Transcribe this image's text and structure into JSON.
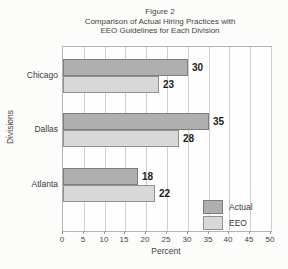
{
  "figure": {
    "title_line1": "Figure 2",
    "title_line2": "Comparison of Actual Hiring Practices with",
    "title_line3": "EEO Guidelines for Each Division"
  },
  "chart_data": {
    "type": "bar",
    "orientation": "horizontal",
    "title": "Figure 2 Comparison of Actual Hiring Practices with EEO Guidelines for Each Division",
    "categories": [
      "Chicago",
      "Dallas",
      "Atlanta"
    ],
    "series": [
      {
        "name": "Actual",
        "values": [
          30,
          35,
          18
        ],
        "fill": "#afafaf",
        "border": "#7d7d7d"
      },
      {
        "name": "EEO",
        "values": [
          23,
          28,
          22
        ],
        "fill": "#d8d8d8",
        "border": "#919191"
      }
    ],
    "xlabel": "Percent",
    "ylabel": "Divisions",
    "xlim": [
      0,
      50
    ],
    "xticks": [
      0,
      5,
      10,
      15,
      20,
      25,
      30,
      35,
      40,
      45,
      50
    ],
    "grid": "vertical",
    "legend_position": "inside-bottom-right",
    "value_labels": true
  }
}
